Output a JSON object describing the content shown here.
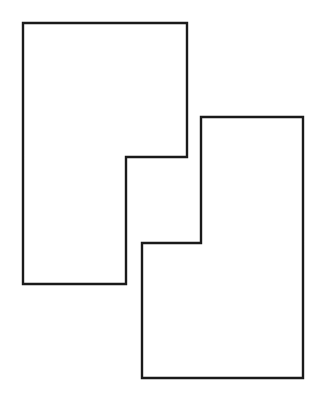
{
  "figure": {
    "caption": "",
    "background_color": "#ffffff",
    "stroke_color": "#1a1a1a",
    "stroke_width": 2.4,
    "fill_color": "#ffffff",
    "canvas": {
      "width": 323,
      "height": 400
    },
    "shapes": [
      {
        "id": "left-shape",
        "name": "upper-left-step-polygon",
        "kind": "polygon",
        "points": "23,23 187,23 187,157 126,157 126,284 23,284",
        "vertices": [
          [
            23,
            23
          ],
          [
            187,
            23
          ],
          [
            187,
            157
          ],
          [
            126,
            157
          ],
          [
            126,
            284
          ],
          [
            23,
            284
          ]
        ]
      },
      {
        "id": "right-shape",
        "name": "lower-right-step-polygon",
        "kind": "polygon",
        "points": "201,117 303,117 303,378 142,378 142,243 201,243",
        "vertices": [
          [
            201,
            117
          ],
          [
            303,
            117
          ],
          [
            303,
            378
          ],
          [
            142,
            378
          ],
          [
            142,
            243
          ],
          [
            201,
            243
          ]
        ]
      }
    ]
  }
}
